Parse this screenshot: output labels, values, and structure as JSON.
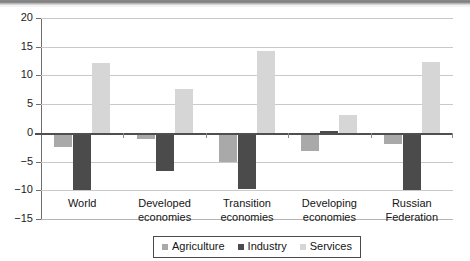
{
  "chart_data": {
    "type": "bar",
    "title": "",
    "subtitle": "",
    "xlabel": "",
    "ylabel": "",
    "categories": [
      "World",
      "Developed economies",
      "Transition economies",
      "Developing economies",
      "Russian Federation"
    ],
    "category_lines": [
      [
        "World"
      ],
      [
        "Developed",
        "economies"
      ],
      [
        "Transition",
        "economies"
      ],
      [
        "Developing",
        "economies"
      ],
      [
        "Russian",
        "Federation"
      ]
    ],
    "series": [
      {
        "name": "Agriculture",
        "color": "#a9a9a9",
        "values": [
          -2.5,
          -1.0,
          -5.0,
          -3.2,
          -2.0
        ]
      },
      {
        "name": "Industry",
        "color": "#4b4b4b",
        "values": [
          -9.9,
          -6.6,
          -9.8,
          0.4,
          -10.0
        ]
      },
      {
        "name": "Services",
        "color": "#d6d6d6",
        "values": [
          12.2,
          7.7,
          14.3,
          3.1,
          12.4
        ]
      }
    ],
    "ylim": [
      -15,
      20
    ],
    "ytick_values": [
      20,
      15,
      10,
      5,
      0,
      -5,
      -10,
      -15
    ],
    "ytick_labels": [
      "20",
      "15",
      "10",
      "5",
      "0",
      "−5",
      "−10",
      "−15"
    ],
    "grid": true,
    "legend_position": "bottom",
    "zero_line": true
  }
}
